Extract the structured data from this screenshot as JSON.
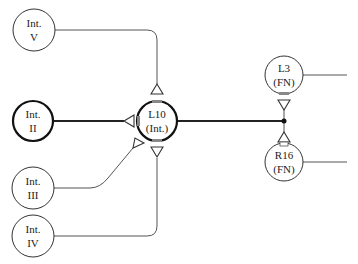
{
  "diagram": {
    "hub": {
      "line1": "L10",
      "line2": "(Int.)"
    },
    "inputs": [
      {
        "id": "int-v",
        "line1": "Int.",
        "line2": "V"
      },
      {
        "id": "int-ii",
        "line1": "Int.",
        "line2": "II"
      },
      {
        "id": "int-iii",
        "line1": "Int.",
        "line2": "III"
      },
      {
        "id": "int-iv",
        "line1": "Int.",
        "line2": "IV"
      }
    ],
    "outputs": [
      {
        "id": "l3",
        "line1": "L3",
        "line2": "(FN)"
      },
      {
        "id": "r16",
        "line1": "R16",
        "line2": "(FN)"
      }
    ]
  }
}
